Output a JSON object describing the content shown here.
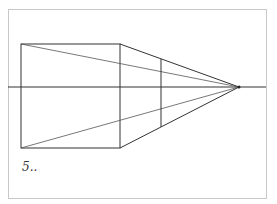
{
  "diagram": {
    "label": "5..",
    "frame": {
      "x": 8,
      "y": 9,
      "w": 258,
      "h": 189,
      "stroke": "#c8c8c8"
    },
    "horizon_y": 87,
    "vanishing_point": {
      "x": 239,
      "y": 87
    },
    "square": {
      "x1": 21,
      "y1": 44,
      "x2": 120,
      "y2": 148
    },
    "inner_vertical": {
      "x": 161,
      "y1": 59,
      "y2": 127
    },
    "line_color": "#333333"
  }
}
